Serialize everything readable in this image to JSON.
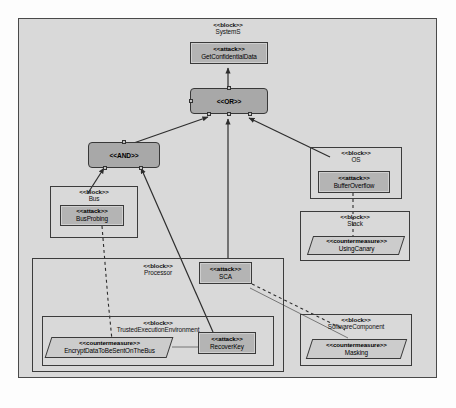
{
  "diagram": {
    "frame_fill": "#d9d9d9",
    "frame_stroke": "#4a4a4a",
    "stereotype_markers": {
      "block": "<<block>>",
      "attack": "<<attack>>",
      "countermeasure": "<<countermeasure>>",
      "or_gate": "<<OR>>",
      "and_gate": "<<AND>>"
    },
    "colors": {
      "gate_fill": "#a8a8a8",
      "attack_fill": "#b4b4b4",
      "countermeasure_fill": "#cccccc",
      "block_stroke": "#3c3c3c",
      "connector": "#2d2d2d"
    }
  },
  "nodes": {
    "system_block": {
      "stereotype": "<<block>>",
      "name": "SystemS"
    },
    "get_confidential_data": {
      "stereotype": "<<attack>>",
      "name": "GetConfidentialData"
    },
    "or_gate": {
      "stereotype": "<<OR>>",
      "name": ""
    },
    "and_gate": {
      "stereotype": "<<AND>>",
      "name": ""
    },
    "bus_block": {
      "stereotype": "<<block>>",
      "name": "Bus"
    },
    "bus_probing": {
      "stereotype": "<<attack>>",
      "name": "BusProbing"
    },
    "os_block": {
      "stereotype": "<<block>>",
      "name": "OS"
    },
    "buffer_overflow": {
      "stereotype": "<<attack>>",
      "name": "BufferOverflow"
    },
    "stack_block": {
      "stereotype": "<<block>>",
      "name": "Stack"
    },
    "using_canary": {
      "stereotype": "<<countermeasure>>",
      "name": "UsingCanary"
    },
    "sca_attack": {
      "stereotype": "<<attack>>",
      "name": "SCA"
    },
    "processor_block": {
      "stereotype": "<<block>>",
      "name": "Processor"
    },
    "tee_block": {
      "stereotype": "<<block>>",
      "name": "TrustedExecutionEnvironment"
    },
    "encrypt_data_cm": {
      "stereotype": "<<countermeasure>>",
      "name": "EncryptDataToBeSentOnTheBus"
    },
    "recover_key": {
      "stereotype": "<<attack>>",
      "name": "RecoverKey"
    },
    "software_component_block": {
      "stereotype": "<<block>>",
      "name": "SoftwareComponent"
    },
    "masking_cm": {
      "stereotype": "<<countermeasure>>",
      "name": "Masking"
    }
  },
  "edges": [
    {
      "from": "or_gate",
      "to": "get_confidential_data",
      "style": "solid-arrow"
    },
    {
      "from": "and_gate",
      "to": "or_gate",
      "style": "solid-arrow"
    },
    {
      "from": "sca_attack",
      "to": "or_gate",
      "style": "solid-arrow"
    },
    {
      "from": "buffer_overflow",
      "to": "or_gate",
      "style": "solid-arrow"
    },
    {
      "from": "bus_probing",
      "to": "and_gate",
      "style": "solid-arrow"
    },
    {
      "from": "recover_key",
      "to": "and_gate",
      "style": "solid-arrow"
    },
    {
      "from": "bus_probing",
      "to": "encrypt_data_cm",
      "style": "dashed"
    },
    {
      "from": "buffer_overflow",
      "to": "using_canary",
      "style": "dashed"
    },
    {
      "from": "sca_attack",
      "to": "masking_cm",
      "style": "dashed"
    },
    {
      "from": "encrypt_data_cm",
      "to": "recover_key",
      "style": "solid-line"
    },
    {
      "from": "masking_cm",
      "to": "sca_attack",
      "style": "solid-line"
    }
  ]
}
